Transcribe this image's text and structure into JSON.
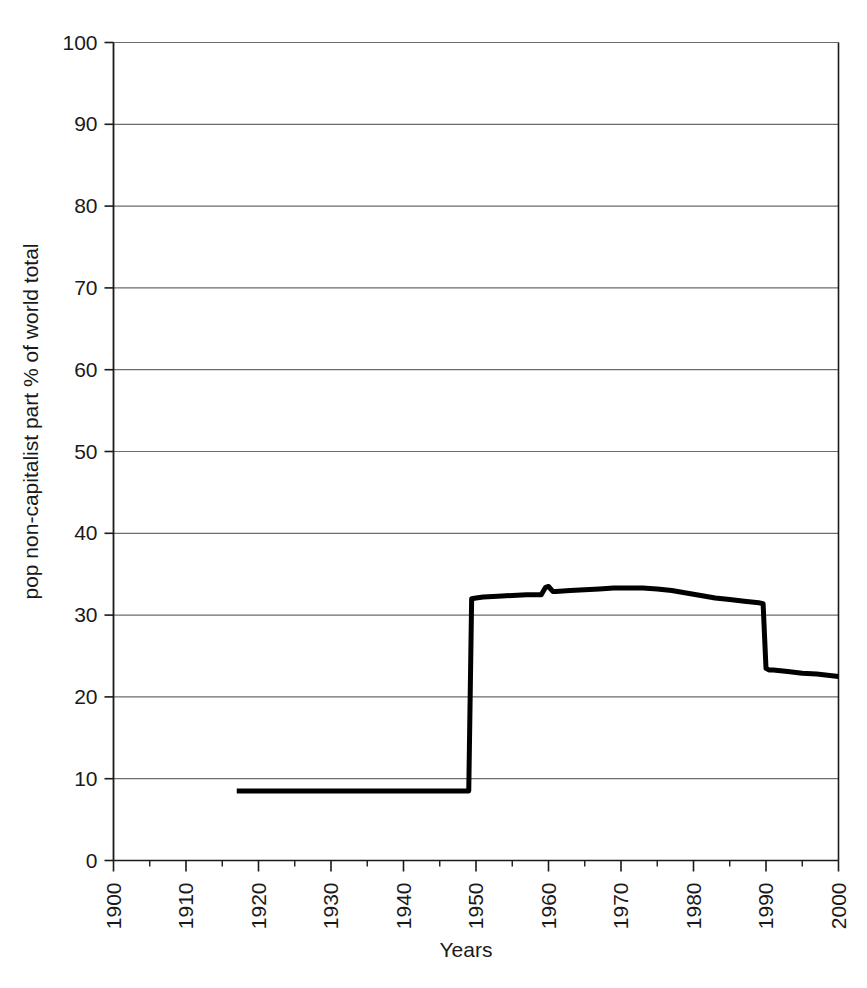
{
  "chart_data": {
    "type": "line",
    "title": "",
    "subtitle": "",
    "xlabel": "Years",
    "ylabel": "pop non-capitalist part  % of world total",
    "xlim": [
      1900,
      2000
    ],
    "ylim": [
      0,
      100
    ],
    "grid": "horizontal",
    "legend": "none",
    "x_major_ticks": [
      1900,
      1910,
      1920,
      1930,
      1940,
      1950,
      1960,
      1970,
      1980,
      1990,
      2000
    ],
    "x_minor_ticks": [
      1905,
      1915,
      1925,
      1935,
      1945,
      1955,
      1965,
      1975,
      1985,
      1995
    ],
    "x_tick_labels": [
      "1900",
      "1910",
      "1920",
      "1930",
      "1940",
      "1950",
      "1960",
      "1970",
      "1980",
      "1990",
      "2000"
    ],
    "x_tick_label_rotation": -90,
    "y_ticks": [
      0,
      10,
      20,
      30,
      40,
      50,
      60,
      70,
      80,
      90,
      100
    ],
    "y_tick_labels": [
      "0",
      "10",
      "20",
      "30",
      "40",
      "50",
      "60",
      "70",
      "80",
      "90",
      "100"
    ],
    "line_color": "#000000",
    "line_width_px": 5,
    "series": [
      {
        "name": "pop non-capitalist part % of world total",
        "x": [
          1917,
          1920,
          1925,
          1930,
          1935,
          1940,
          1945,
          1948,
          1949,
          1949.4,
          1950,
          1951,
          1953,
          1955,
          1957,
          1959,
          1959.6,
          1960,
          1960.6,
          1961,
          1963,
          1965,
          1967,
          1969,
          1971,
          1973,
          1975,
          1977,
          1979,
          1981,
          1983,
          1985,
          1987,
          1989,
          1989.6,
          1990,
          1990.4,
          1991,
          1993,
          1995,
          1997,
          2000
        ],
        "y": [
          8.5,
          8.5,
          8.5,
          8.5,
          8.5,
          8.5,
          8.5,
          8.5,
          8.5,
          32.0,
          32.1,
          32.2,
          32.3,
          32.4,
          32.5,
          32.5,
          33.4,
          33.5,
          32.9,
          32.9,
          33.0,
          33.1,
          33.2,
          33.3,
          33.3,
          33.3,
          33.2,
          33.0,
          32.7,
          32.4,
          32.1,
          31.9,
          31.7,
          31.5,
          31.4,
          23.5,
          23.3,
          23.3,
          23.1,
          22.9,
          22.8,
          22.5
        ]
      }
    ],
    "annotations": [
      {
        "text": "flat plateau ~8.5% from 1917 to 1949"
      },
      {
        "text": "step rise to ~32% at 1949-1950"
      },
      {
        "text": "local bump to ~33.5% at 1960"
      },
      {
        "text": "broad maximum ~33.3% around 1971-1973"
      },
      {
        "text": "step fall to ~23.3% at 1990"
      },
      {
        "text": "gentle decline to ~22.5% at 2000"
      }
    ]
  },
  "axes": {
    "x_title": "Years",
    "y_title": "pop non-capitalist part  % of world total"
  },
  "colors": {
    "line": "#000000",
    "grid": "#6b6b6b",
    "axis": "#1a1a1a",
    "background": "#ffffff"
  }
}
